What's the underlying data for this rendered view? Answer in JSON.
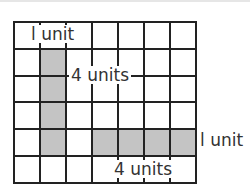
{
  "diagram": {
    "grid": {
      "columns": 7,
      "rows": 6
    },
    "shaded_regions": [
      {
        "name": "vertical-bar",
        "column": 2,
        "rows": [
          2,
          3,
          4,
          5
        ]
      },
      {
        "name": "horizontal-bar",
        "row": 5,
        "columns": [
          4,
          5,
          6,
          7
        ]
      }
    ],
    "labels": {
      "vertical_width": "l unit",
      "vertical_length": "4 units",
      "horizontal_length": "4 units",
      "horizontal_width": "l unit"
    },
    "colors": {
      "shade": "#c4c4c4",
      "line": "#222222"
    }
  }
}
